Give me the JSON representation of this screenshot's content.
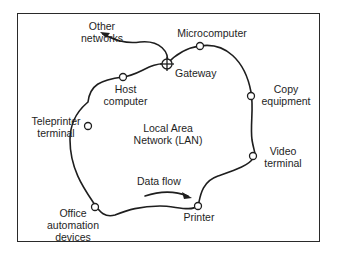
{
  "diagram": {
    "title": "Local Area Network (LAN)",
    "center_label": {
      "line1": "Local Area",
      "line2": "Network (LAN)"
    },
    "flow_label": "Data flow",
    "nodes": [
      {
        "id": "microcomputer",
        "line1": "Microcomputer",
        "line2": ""
      },
      {
        "id": "gateway",
        "line1": "Gateway",
        "line2": ""
      },
      {
        "id": "other-networks",
        "line1": "Other",
        "line2": "networks"
      },
      {
        "id": "host-computer",
        "line1": "Host",
        "line2": "computer"
      },
      {
        "id": "teleprinter-terminal",
        "line1": "Teleprinter",
        "line2": "terminal"
      },
      {
        "id": "copy-equipment",
        "line1": "Copy",
        "line2": "equipment"
      },
      {
        "id": "video-terminal",
        "line1": "Video",
        "line2": "terminal"
      },
      {
        "id": "printer",
        "line1": "Printer",
        "line2": ""
      },
      {
        "id": "office-automation-devices",
        "line1": "Office",
        "line2": "automation",
        "line3": "devices"
      }
    ],
    "colors": {
      "line": "#1e1e1e",
      "background": "#ffffff"
    }
  }
}
